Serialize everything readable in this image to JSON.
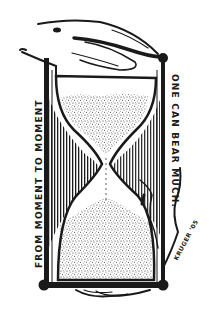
{
  "illustration": {
    "subject": "hourglass held by a hand",
    "left_caption": "FROM MOMENT TO MOMENT",
    "right_caption": "ONE CAN BEAR MUCH.",
    "signature": "KRUGER '05",
    "colors": {
      "ink": "#1a1a1a",
      "paper": "#ffffff",
      "sand": "#5a5a5a"
    }
  }
}
